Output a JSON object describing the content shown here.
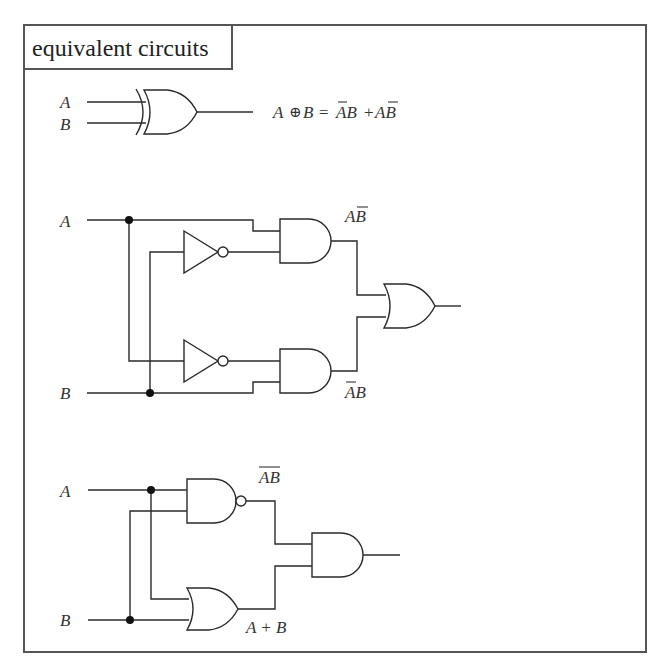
{
  "title": "equivalent circuits",
  "colors": {
    "line": "#2a2a2a",
    "frame": "#555555",
    "background": "#ffffff"
  },
  "xor_circuit": {
    "input_a": "A",
    "input_b": "B",
    "equation": {
      "lhs_a": "A",
      "xor_symbol": "⊕",
      "lhs_b": "B =",
      "term1": "AB",
      "plus": "+",
      "term2": "AB",
      "description": "A XOR B = (NOT A)B + A(NOT B)"
    }
  },
  "and_or_circuit": {
    "input_a": "A",
    "input_b": "B",
    "top_and_output": "AB",
    "top_and_output_meaning": "A AND (NOT B)",
    "bottom_and_output": "AB",
    "bottom_and_output_meaning": "(NOT A) AND B",
    "gates": [
      "NOT",
      "NOT",
      "AND",
      "AND",
      "OR"
    ]
  },
  "nand_or_circuit": {
    "input_a": "A",
    "input_b": "B",
    "nand_output": "AB",
    "nand_output_meaning": "NOT (A AND B)",
    "or_output": "A + B",
    "gates": [
      "NAND",
      "OR",
      "AND"
    ]
  }
}
